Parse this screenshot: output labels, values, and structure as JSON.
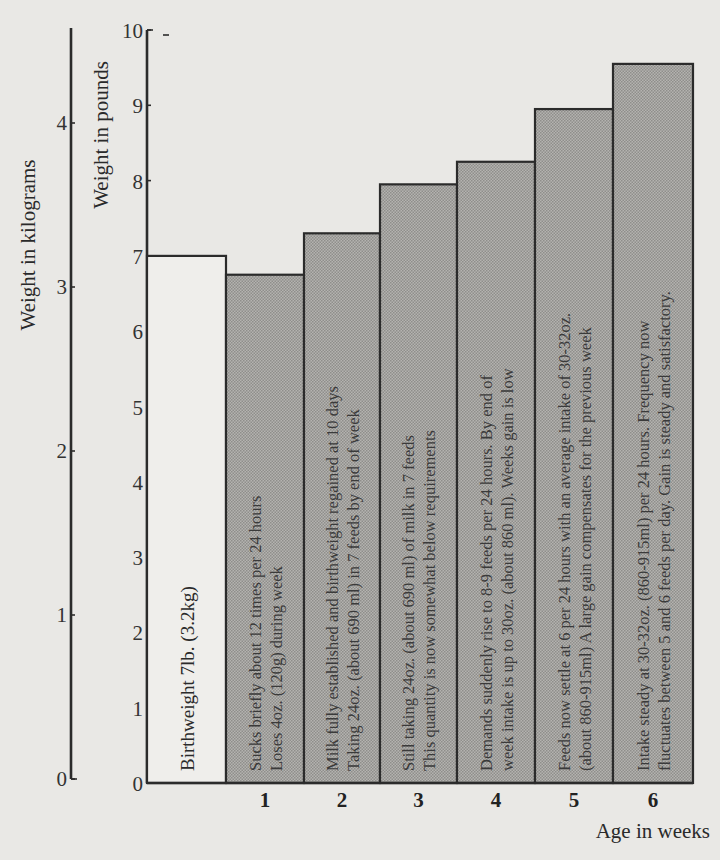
{
  "chart_data": {
    "type": "bar",
    "title": "",
    "xlabel": "Age in weeks",
    "ylabel": "Weight in pounds",
    "ylabel_secondary": "Weight in kilograms",
    "ylim": [
      0,
      10
    ],
    "ylim_secondary": [
      0,
      4.54
    ],
    "yticks": [
      0,
      1,
      2,
      3,
      4,
      5,
      6,
      7,
      8,
      9,
      10
    ],
    "yticks_secondary": [
      0,
      1,
      2,
      3,
      4
    ],
    "grid": false,
    "legend": null,
    "categories": [
      "0",
      "1",
      "2",
      "3",
      "4",
      "5",
      "6"
    ],
    "x_tick_labels": [
      "",
      "1",
      "2",
      "3",
      "4",
      "5",
      "6"
    ],
    "values": [
      7.0,
      6.75,
      7.3,
      7.95,
      8.25,
      8.95,
      9.55
    ],
    "units": "lb",
    "bars": [
      {
        "week": 0,
        "weight_lb": 7.0,
        "fill": "white",
        "annotation": [
          "Birthweight 7lb. (3.2kg)"
        ]
      },
      {
        "week": 1,
        "weight_lb": 6.75,
        "fill": "shaded",
        "annotation": [
          "Sucks briefly about 12 times per 24 hours",
          "Loses 4oz. (120g) during week"
        ]
      },
      {
        "week": 2,
        "weight_lb": 7.3,
        "fill": "shaded",
        "annotation": [
          "Milk fully established and birthweight regained at 10 days",
          "Taking 24oz. (about 690 ml) in 7 feeds by end of week"
        ]
      },
      {
        "week": 3,
        "weight_lb": 7.95,
        "fill": "shaded",
        "annotation": [
          "Still taking 24oz. (about 690 ml) of milk in 7 feeds",
          "This quantity is now somewhat below requirements"
        ]
      },
      {
        "week": 4,
        "weight_lb": 8.25,
        "fill": "shaded",
        "annotation": [
          "Demands suddenly rise to 8-9 feeds per 24 hours. By end of",
          "week intake is up to 30oz. (about 860 ml). Weeks gain is low"
        ]
      },
      {
        "week": 5,
        "weight_lb": 8.95,
        "fill": "shaded",
        "annotation": [
          "Feeds now settle at 6 per 24 hours with an average intake of 30-32oz.",
          "(about 860-915ml) A large gain compensates for the previous week"
        ]
      },
      {
        "week": 6,
        "weight_lb": 9.55,
        "fill": "shaded",
        "annotation": [
          "Intake steady at 30-32oz. (860-915ml) per 24 hours. Frequency now",
          "fluctuates between 5 and 6 feeds per day. Gain is steady and satisfactory."
        ]
      }
    ],
    "colors": {
      "background": "#e9e8e5",
      "bar_shaded": "#a9a8a5",
      "bar_birth": "#efeeeb",
      "ink": "#2b2b2b"
    }
  }
}
